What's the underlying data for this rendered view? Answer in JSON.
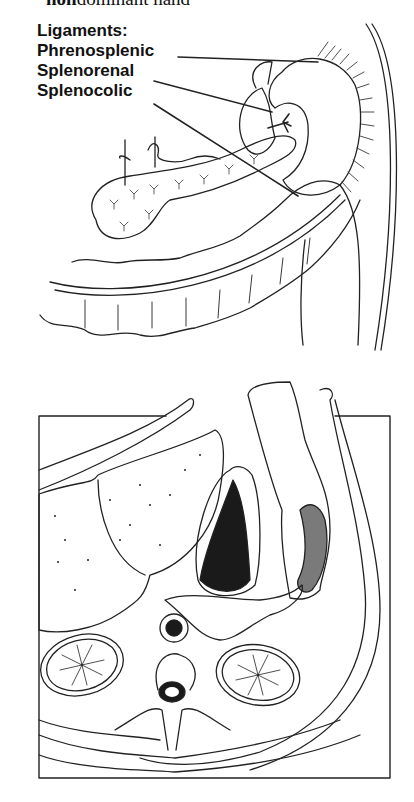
{
  "caption_fragment": {
    "bold": "non",
    "rest": "dominant hand"
  },
  "figure_top": {
    "heading": "Ligaments:",
    "labels": [
      {
        "text": "Phrenosplenic"
      },
      {
        "text": "Splenorenal"
      },
      {
        "text": "Splenocolic"
      }
    ],
    "depicted": [
      "spleen",
      "pancreas",
      "transverse colon",
      "descending colon",
      "kidney",
      "vessels"
    ]
  },
  "figure_bottom": {
    "description": "Axial cross-section of upper abdomen showing liver, stomach, spleen (shaded), pancreas, kidneys, aorta, vertebra",
    "colors": {
      "stomach_contents": "#1a1a1a",
      "spleen": "#7a7a7a",
      "line": "#222222"
    }
  }
}
